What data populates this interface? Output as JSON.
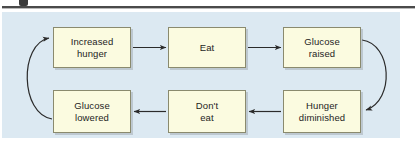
{
  "figure": {
    "background_color": "#ffffff",
    "panel_color": "#dce9f2",
    "node_fill_color": "#fbfbe0",
    "node_border_color": "#8a8a6e",
    "line_color": "#2b2b2b",
    "caption_rule_color": "#4a4a4a"
  },
  "diagram": {
    "type": "cycle-flowchart",
    "nodes": [
      {
        "id": "increased-hunger",
        "label_line1": "Increased",
        "label_line2": "hunger"
      },
      {
        "id": "eat",
        "label_line1": "Eat",
        "label_line2": ""
      },
      {
        "id": "glucose-raised",
        "label_line1": "Glucose",
        "label_line2": "raised"
      },
      {
        "id": "hunger-diminished",
        "label_line1": "Hunger",
        "label_line2": "diminished"
      },
      {
        "id": "dont-eat",
        "label_line1": "Don't",
        "label_line2": "eat"
      },
      {
        "id": "glucose-lowered",
        "label_line1": "Glucose",
        "label_line2": "lowered"
      }
    ],
    "edges": [
      {
        "id": "e1",
        "from": "increased-hunger",
        "to": "eat",
        "style": "straight",
        "direction": "right"
      },
      {
        "id": "e2",
        "from": "eat",
        "to": "glucose-raised",
        "style": "straight",
        "direction": "right"
      },
      {
        "id": "e3",
        "from": "glucose-raised",
        "to": "hunger-diminished",
        "style": "curved",
        "direction": "down-left"
      },
      {
        "id": "e4",
        "from": "hunger-diminished",
        "to": "dont-eat",
        "style": "straight",
        "direction": "left"
      },
      {
        "id": "e5",
        "from": "dont-eat",
        "to": "glucose-lowered",
        "style": "straight",
        "direction": "left"
      },
      {
        "id": "e6",
        "from": "glucose-lowered",
        "to": "increased-hunger",
        "style": "curved",
        "direction": "up-right"
      }
    ]
  }
}
